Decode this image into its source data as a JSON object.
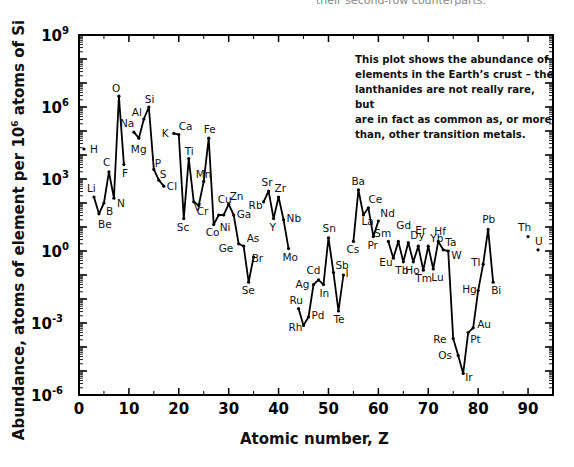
{
  "page": {
    "top_cut_text": "their second-row counterparts."
  },
  "chart_data": {
    "type": "line",
    "title": "",
    "xlabel": "Atomic number, Z",
    "ylabel_parts": [
      "Abundance, atoms of element per 10",
      "6",
      " atoms of Si"
    ],
    "ylabel": "Abundance, atoms of element per 10^6 atoms of Si",
    "yscale": "log",
    "xlim": [
      0,
      95
    ],
    "ylim_log10": [
      -6,
      9
    ],
    "x_ticks": [
      0,
      10,
      20,
      30,
      40,
      50,
      60,
      70,
      80,
      90
    ],
    "x_minor_ticks": [
      5,
      15,
      25,
      35,
      45,
      55,
      65,
      75,
      85
    ],
    "y_ticks": [
      {
        "exp": 9,
        "label": "10",
        "sup": "9"
      },
      {
        "exp": 6,
        "label": "10",
        "sup": "6"
      },
      {
        "exp": 3,
        "label": "10",
        "sup": "3"
      },
      {
        "exp": 0,
        "label": "10",
        "sup": "0"
      },
      {
        "exp": -3,
        "label": "10",
        "sup": "-3"
      },
      {
        "exp": -6,
        "label": "10",
        "sup": "-6"
      }
    ],
    "grid": false,
    "legend": null,
    "annotation": "This plot shows the abundance of elements in the Earth’s crust – the lanthanides are not really rare, but are in fact as common as, or more than, other transition metals.",
    "annotation_lines": [
      "This plot shows the abundance of",
      "elements in the Earth’s crust – the",
      "lanthanides are not really rare, but",
      "are in fact as common as, or more",
      "than, other transition metals."
    ],
    "segments_note": "Lines connect consecutive plotted elements; breaks occur where elements are missing.",
    "points": [
      {
        "z": 1,
        "el": "H",
        "log10": 4.25,
        "lx": 6,
        "ly": 4
      },
      {
        "z": 3,
        "el": "Li",
        "log10": 2.25,
        "lx": -7,
        "ly": -5
      },
      {
        "z": 4,
        "el": "Be",
        "log10": 1.55,
        "lx": -1,
        "ly": 14
      },
      {
        "z": 5,
        "el": "B",
        "log10": 2.0,
        "lx": 2,
        "ly": 12
      },
      {
        "z": 6,
        "el": "C",
        "log10": 3.3,
        "lx": -6,
        "ly": -6
      },
      {
        "z": 7,
        "el": "N",
        "log10": 2.2,
        "lx": 3,
        "ly": 9
      },
      {
        "z": 8,
        "el": "O",
        "log10": 6.45,
        "lx": -7,
        "ly": -4
      },
      {
        "z": 9,
        "el": "F",
        "log10": 3.6,
        "lx": -2,
        "ly": 12
      },
      {
        "z": 11,
        "el": "Na",
        "log10": 4.95,
        "lx": -14,
        "ly": -5
      },
      {
        "z": 12,
        "el": "Mg",
        "log10": 4.7,
        "lx": -8,
        "ly": 15
      },
      {
        "z": 13,
        "el": "Al",
        "log10": 5.5,
        "lx": -12,
        "ly": -3
      },
      {
        "z": 14,
        "el": "Si",
        "log10": 6.0,
        "lx": -4,
        "ly": -4
      },
      {
        "z": 15,
        "el": "P",
        "log10": 3.4,
        "lx": 1,
        "ly": -2
      },
      {
        "z": 16,
        "el": "S",
        "log10": 2.95,
        "lx": 1,
        "ly": -2
      },
      {
        "z": 17,
        "el": "Cl",
        "log10": 2.7,
        "lx": 3,
        "ly": 4
      },
      {
        "z": 19,
        "el": "K",
        "log10": 4.9,
        "lx": -12,
        "ly": 4
      },
      {
        "z": 20,
        "el": "Ca",
        "log10": 4.85,
        "lx": 0,
        "ly": -5
      },
      {
        "z": 21,
        "el": "Sc",
        "log10": 1.35,
        "lx": -7,
        "ly": 12
      },
      {
        "z": 22,
        "el": "Ti",
        "log10": 3.85,
        "lx": -4,
        "ly": -4
      },
      {
        "z": 23,
        "el": "V",
        "log10": 2.05,
        "lx": 0,
        "ly": 9
      },
      {
        "z": 24,
        "el": "Cr",
        "log10": 1.9,
        "lx": -2,
        "ly": 10
      },
      {
        "z": 25,
        "el": "Mn",
        "log10": 2.9,
        "lx": -8,
        "ly": -3
      },
      {
        "z": 26,
        "el": "Fe",
        "log10": 4.7,
        "lx": -5,
        "ly": -5
      },
      {
        "z": 27,
        "el": "Co",
        "log10": 1.1,
        "lx": -8,
        "ly": 11
      },
      {
        "z": 28,
        "el": "Ni",
        "log10": 1.5,
        "lx": 1,
        "ly": 16
      },
      {
        "z": 29,
        "el": "Cu",
        "log10": 1.5,
        "lx": -6,
        "ly": -12
      },
      {
        "z": 30,
        "el": "Zn",
        "log10": 1.95,
        "lx": 1,
        "ly": -4
      },
      {
        "z": 31,
        "el": "Ga",
        "log10": 1.5,
        "lx": 3,
        "ly": 3
      },
      {
        "z": 32,
        "el": "Ge",
        "log10": 0.3,
        "lx": -20,
        "ly": 8
      },
      {
        "z": 33,
        "el": "As",
        "log10": 0.2,
        "lx": 3,
        "ly": -4
      },
      {
        "z": 34,
        "el": "Se",
        "log10": -1.3,
        "lx": -7,
        "ly": 12
      },
      {
        "z": 35,
        "el": "Br",
        "log10": -0.25,
        "lx": -2,
        "ly": 5
      },
      {
        "z": 37,
        "el": "Rb",
        "log10": 2.05,
        "lx": -15,
        "ly": 7
      },
      {
        "z": 38,
        "el": "Sr",
        "log10": 2.5,
        "lx": -7,
        "ly": -5
      },
      {
        "z": 39,
        "el": "Y",
        "log10": 1.35,
        "lx": -4,
        "ly": 12
      },
      {
        "z": 40,
        "el": "Zr",
        "log10": 2.25,
        "lx": -4,
        "ly": -5
      },
      {
        "z": 41,
        "el": "Nb",
        "log10": 1.3,
        "lx": 3,
        "ly": 2
      },
      {
        "z": 42,
        "el": "Mo",
        "log10": 0.1,
        "lx": -6,
        "ly": 12
      },
      {
        "z": 44,
        "el": "Ru",
        "log10": -2.4,
        "lx": -9,
        "ly": -5
      },
      {
        "z": 45,
        "el": "Rh",
        "log10": -3.1,
        "lx": -15,
        "ly": 6
      },
      {
        "z": 46,
        "el": "Pd",
        "log10": -2.75,
        "lx": 3,
        "ly": 2
      },
      {
        "z": 47,
        "el": "Ag",
        "log10": -1.4,
        "lx": -18,
        "ly": 3
      },
      {
        "z": 48,
        "el": "Cd",
        "log10": -1.2,
        "lx": -12,
        "ly": -6
      },
      {
        "z": 49,
        "el": "In",
        "log10": -1.4,
        "lx": -4,
        "ly": 12
      },
      {
        "z": 50,
        "el": "Sn",
        "log10": 0.55,
        "lx": -6,
        "ly": -6
      },
      {
        "z": 51,
        "el": "Sb",
        "log10": -0.9,
        "lx": 2,
        "ly": -4
      },
      {
        "z": 52,
        "el": "Te",
        "log10": -2.5,
        "lx": -5,
        "ly": 12
      },
      {
        "z": 53,
        "el": "I",
        "log10": -1.0,
        "lx": 2,
        "ly": 2
      },
      {
        "z": 55,
        "el": "Cs",
        "log10": 0.4,
        "lx": -7,
        "ly": 12
      },
      {
        "z": 56,
        "el": "Ba",
        "log10": 2.55,
        "lx": -7,
        "ly": -5
      },
      {
        "z": 57,
        "el": "La",
        "log10": 1.5,
        "lx": -2,
        "ly": 10
      },
      {
        "z": 58,
        "el": "Ce",
        "log10": 1.8,
        "lx": 0,
        "ly": -5
      },
      {
        "z": 59,
        "el": "Pr",
        "log10": 0.6,
        "lx": -6,
        "ly": 12
      },
      {
        "z": 60,
        "el": "Nd",
        "log10": 1.25,
        "lx": 2,
        "ly": -4
      },
      {
        "z": 62,
        "el": "Sm",
        "log10": 0.4,
        "lx": -14,
        "ly": -4
      },
      {
        "z": 63,
        "el": "Eu",
        "log10": -0.3,
        "lx": -14,
        "ly": 8
      },
      {
        "z": 64,
        "el": "Gd",
        "log10": 0.4,
        "lx": -2,
        "ly": -12
      },
      {
        "z": 65,
        "el": "Tb",
        "log10": -0.45,
        "lx": -8,
        "ly": 12
      },
      {
        "z": 66,
        "el": "Dy",
        "log10": 0.35,
        "lx": 2,
        "ly": -4
      },
      {
        "z": 67,
        "el": "Ho",
        "log10": -0.45,
        "lx": -8,
        "ly": 12
      },
      {
        "z": 68,
        "el": "Er",
        "log10": 0.2,
        "lx": -3,
        "ly": -12
      },
      {
        "z": 69,
        "el": "Tm",
        "log10": -0.8,
        "lx": -8,
        "ly": 12
      },
      {
        "z": 70,
        "el": "Yb",
        "log10": 0.2,
        "lx": 2,
        "ly": -4
      },
      {
        "z": 71,
        "el": "Lu",
        "log10": -0.75,
        "lx": -2,
        "ly": 12
      },
      {
        "z": 72,
        "el": "Hf",
        "log10": 0.4,
        "lx": -4,
        "ly": -6
      },
      {
        "z": 73,
        "el": "Ta",
        "log10": 0.05,
        "lx": 2,
        "ly": -4
      },
      {
        "z": 74,
        "el": "W",
        "log10": 0.0,
        "lx": 3,
        "ly": 8
      },
      {
        "z": 75,
        "el": "Re",
        "log10": -3.65,
        "lx": -20,
        "ly": 4
      },
      {
        "z": 76,
        "el": "Os",
        "log10": -4.35,
        "lx": -20,
        "ly": 4
      },
      {
        "z": 77,
        "el": "Ir",
        "log10": -5.1,
        "lx": 2,
        "ly": 8
      },
      {
        "z": 78,
        "el": "Pt",
        "log10": -3.4,
        "lx": 2,
        "ly": 10
      },
      {
        "z": 79,
        "el": "Au",
        "log10": -3.2,
        "lx": 4,
        "ly": 0
      },
      {
        "z": 80,
        "el": "Hg",
        "log10": -1.65,
        "lx": -16,
        "ly": 2
      },
      {
        "z": 81,
        "el": "Tl",
        "log10": -0.55,
        "lx": -12,
        "ly": 2
      },
      {
        "z": 82,
        "el": "Pb",
        "log10": 0.9,
        "lx": -6,
        "ly": -6
      },
      {
        "z": 83,
        "el": "Bi",
        "log10": -1.3,
        "lx": -2,
        "ly": 12
      },
      {
        "z": 90,
        "el": "Th",
        "log10": 0.6,
        "lx": -10,
        "ly": -6
      },
      {
        "z": 92,
        "el": "U",
        "log10": 0.05,
        "lx": -3,
        "ly": -5
      }
    ]
  }
}
